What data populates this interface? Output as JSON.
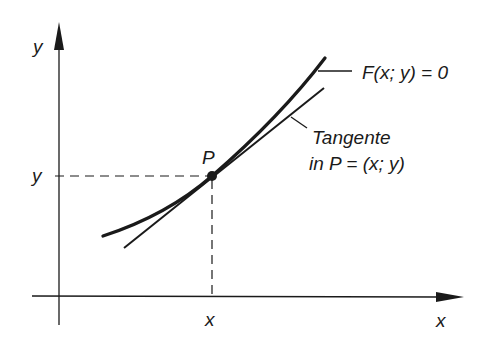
{
  "diagram": {
    "type": "tangent-to-implicit-curve",
    "axes": {
      "y_axis_label": "y",
      "x_axis_label": "x"
    },
    "point": {
      "label": "P",
      "x_tick_label": "x",
      "y_tick_label": "y"
    },
    "curve": {
      "equation_label": "F(x; y) = 0"
    },
    "tangent": {
      "label_line1": "Tangente",
      "label_line2": "in P = (x; y)"
    },
    "colors": {
      "ink": "#1a1a1a",
      "background": "#ffffff"
    }
  }
}
